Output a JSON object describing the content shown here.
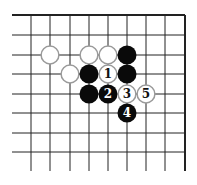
{
  "diagram": {
    "type": "go-board-fragment",
    "grid": {
      "columns_x": [
        31,
        50,
        70,
        89,
        108,
        127,
        146,
        165,
        185
      ],
      "rows_y": [
        15,
        35,
        55,
        74,
        94,
        113,
        133,
        152
      ],
      "line_left_x": 12,
      "line_bottom_y": 171,
      "top_edge": true,
      "right_edge": true,
      "line_color": "#222222"
    },
    "stone_radius": 9.5,
    "colors": {
      "black": "#0a0a0a",
      "white_fill": "#ffffff",
      "white_stroke": "#9a9a9a",
      "number_on_black": "#ffffff",
      "number_on_white": "#111111"
    },
    "stones": [
      {
        "col": 1,
        "row": 2,
        "color": "white",
        "label": ""
      },
      {
        "col": 3,
        "row": 2,
        "color": "white",
        "label": ""
      },
      {
        "col": 4,
        "row": 2,
        "color": "white",
        "label": ""
      },
      {
        "col": 5,
        "row": 2,
        "color": "black",
        "label": ""
      },
      {
        "col": 2,
        "row": 3,
        "color": "white",
        "label": ""
      },
      {
        "col": 3,
        "row": 3,
        "color": "black",
        "label": ""
      },
      {
        "col": 4,
        "row": 3,
        "color": "white",
        "label": "1"
      },
      {
        "col": 5,
        "row": 3,
        "color": "black",
        "label": ""
      },
      {
        "col": 3,
        "row": 4,
        "color": "black",
        "label": ""
      },
      {
        "col": 4,
        "row": 4,
        "color": "black",
        "label": "2"
      },
      {
        "col": 5,
        "row": 4,
        "color": "white",
        "label": "3"
      },
      {
        "col": 6,
        "row": 4,
        "color": "white",
        "label": "5"
      },
      {
        "col": 5,
        "row": 5,
        "color": "black",
        "label": "4"
      }
    ]
  }
}
